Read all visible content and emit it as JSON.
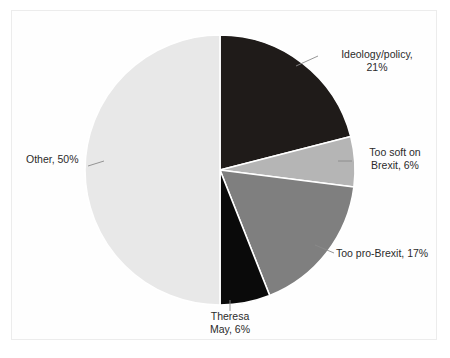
{
  "figure": {
    "background_color": "#ffffff",
    "frame_color": "#ececec",
    "separator_color": "#ffffff"
  },
  "chart_data": {
    "type": "pie",
    "title": "",
    "subtitle": "",
    "xlabel": "",
    "ylabel": "",
    "legend_position": "none",
    "grid": false,
    "start_angle_deg": 0,
    "direction": "clockwise",
    "center": {
      "x": 220,
      "y": 170
    },
    "radius": 135,
    "units": "percent",
    "total": 100,
    "categories": [
      "Ideology/policy",
      "Too soft on Brexit",
      "Too pro-Brexit",
      "Theresa May",
      "Other"
    ],
    "values": [
      21,
      6,
      17,
      6,
      50
    ],
    "colors": [
      "#1f1b19",
      "#b5b5b5",
      "#7f7f7f",
      "#0a0a0a",
      "#e8e8e8"
    ],
    "slices": [
      {
        "name": "Ideology/policy",
        "value": 21,
        "label": "Ideology/policy,\n21%",
        "label_line1": "Ideology/policy,",
        "label_line2": "21%",
        "color": "#1f1b19",
        "start_angle": 0,
        "end_angle": 75.6
      },
      {
        "name": "Too soft on Brexit",
        "value": 6,
        "label": "Too soft on\nBrexit, 6%",
        "label_line1": "Too soft on",
        "label_line2": "Brexit, 6%",
        "color": "#b5b5b5",
        "start_angle": 75.6,
        "end_angle": 97.2
      },
      {
        "name": "Too pro-Brexit",
        "value": 17,
        "label": "Too pro-Brexit, 17%",
        "label_line1": "Too pro-Brexit, 17%",
        "label_line2": "",
        "color": "#7f7f7f",
        "start_angle": 97.2,
        "end_angle": 158.4
      },
      {
        "name": "Theresa May",
        "value": 6,
        "label": "Theresa\nMay, 6%",
        "label_line1": "Theresa",
        "label_line2": "May, 6%",
        "color": "#0a0a0a",
        "start_angle": 158.4,
        "end_angle": 180
      },
      {
        "name": "Other",
        "value": 50,
        "label": "Other, 50%",
        "label_line1": "Other, 50%",
        "label_line2": "",
        "color": "#e8e8e8",
        "start_angle": 180,
        "end_angle": 360
      }
    ]
  }
}
